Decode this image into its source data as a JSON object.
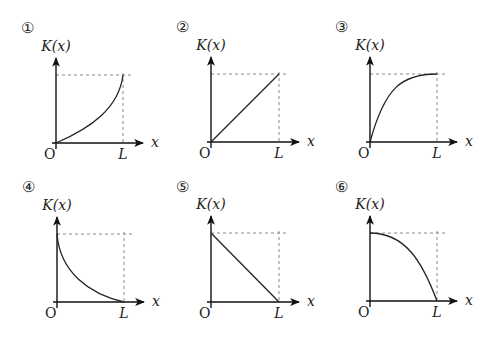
{
  "figure": {
    "y_label": "K(x)",
    "x_label": "x",
    "origin_label": "O",
    "end_label": "L",
    "colors": {
      "axis": "#111111",
      "curve": "#222222",
      "dashed": "#888888"
    }
  },
  "panels": [
    {
      "number": "①",
      "shape": "increasing, concave up (steep near L)",
      "start": "0",
      "end": "max"
    },
    {
      "number": "②",
      "shape": "increasing linear",
      "start": "0",
      "end": "max"
    },
    {
      "number": "③",
      "shape": "increasing, concave down (flat near L)",
      "start": "0",
      "end": "max"
    },
    {
      "number": "④",
      "shape": "decreasing, convex (steep near 0)",
      "start": "max",
      "end": "0"
    },
    {
      "number": "⑤",
      "shape": "decreasing linear",
      "start": "max",
      "end": "0"
    },
    {
      "number": "⑥",
      "shape": "decreasing, concave down (flat near 0)",
      "start": "max",
      "end": "0"
    }
  ]
}
